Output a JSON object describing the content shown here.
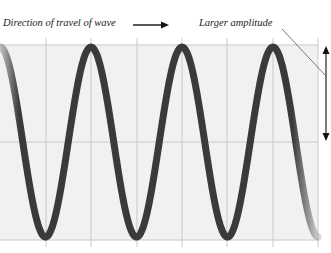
{
  "labels": {
    "direction": "Direction of travel of wave",
    "amplitude": "Larger amplitude"
  },
  "colors": {
    "background": "#ffffff",
    "panel": "#f1f1f1",
    "grid": "#c9c9c9",
    "wave": "#3a3a3a",
    "text": "#222222"
  },
  "wave": {
    "period_px": 91,
    "peak_y": 47,
    "trough_y": 237,
    "center_y": 142,
    "start_x": 0,
    "end_x": 318
  },
  "grid": {
    "vertical_x": [
      46,
      91,
      137,
      182,
      227,
      273,
      318
    ],
    "horizontal_y": [
      45,
      142,
      240
    ]
  }
}
